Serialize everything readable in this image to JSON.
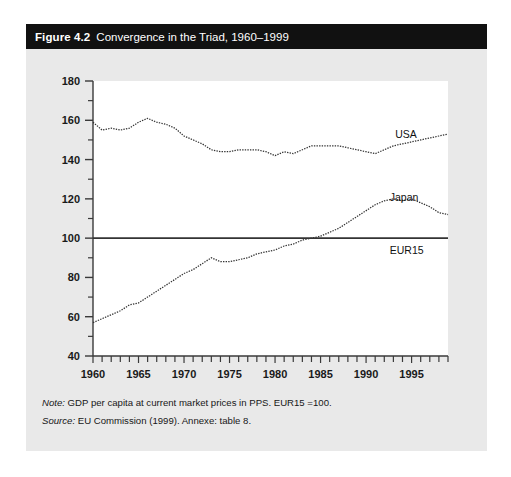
{
  "figure": {
    "number": "Figure 4.2",
    "title": "Convergence in the Triad, 1960–1999",
    "note_keyword": "Note:",
    "note_text": "GDP per capita at current market prices in PPS. EUR15 =100.",
    "source_keyword": "Source:",
    "source_text": "EU Commission (1999). Annexe: table 8."
  },
  "chart_data": {
    "type": "line",
    "title": "Convergence in the Triad, 1960–1999",
    "xlabel": "",
    "ylabel": "",
    "xlim": [
      1960,
      1999
    ],
    "ylim": [
      40,
      180
    ],
    "ytick_major": [
      40,
      60,
      80,
      100,
      120,
      140,
      160,
      180
    ],
    "ytick_minor_step": 10,
    "xtick_labels": [
      1960,
      1965,
      1970,
      1975,
      1980,
      1985,
      1990,
      1995
    ],
    "xtick_step": 1,
    "grid": false,
    "legend_position": "inline-right",
    "annotations": [
      {
        "text": "USA",
        "x": 1993.2,
        "y": 151
      },
      {
        "text": "Japan",
        "x": 1992.6,
        "y": 119
      },
      {
        "text": "EUR15",
        "x": 1992.6,
        "y": 92
      }
    ],
    "x": [
      1960,
      1961,
      1962,
      1963,
      1964,
      1965,
      1966,
      1967,
      1968,
      1969,
      1970,
      1971,
      1972,
      1973,
      1974,
      1975,
      1976,
      1977,
      1978,
      1979,
      1980,
      1981,
      1982,
      1983,
      1984,
      1985,
      1986,
      1987,
      1988,
      1989,
      1990,
      1991,
      1992,
      1993,
      1994,
      1995,
      1996,
      1997,
      1998,
      1999
    ],
    "series": [
      {
        "name": "USA",
        "style": "dotted",
        "values": [
          159,
          155,
          156,
          155,
          156,
          159,
          161,
          159,
          158,
          156,
          152,
          150,
          148,
          145,
          144,
          144,
          145,
          145,
          145,
          144,
          142,
          144,
          143,
          145,
          147,
          147,
          147,
          147,
          146,
          145,
          144,
          143,
          145,
          147,
          148,
          149,
          150,
          151,
          152,
          153
        ]
      },
      {
        "name": "Japan",
        "style": "dotted",
        "values": [
          57,
          59,
          61,
          63,
          66,
          67,
          70,
          73,
          76,
          79,
          82,
          84,
          87,
          90,
          88,
          88,
          89,
          90,
          92,
          93,
          94,
          96,
          97,
          99,
          100,
          101,
          103,
          105,
          108,
          111,
          114,
          117,
          119,
          120,
          119,
          120,
          118,
          116,
          113,
          112
        ]
      },
      {
        "name": "EUR15",
        "style": "solid",
        "values": [
          100,
          100,
          100,
          100,
          100,
          100,
          100,
          100,
          100,
          100,
          100,
          100,
          100,
          100,
          100,
          100,
          100,
          100,
          100,
          100,
          100,
          100,
          100,
          100,
          100,
          100,
          100,
          100,
          100,
          100,
          100,
          100,
          100,
          100,
          100,
          100,
          100,
          100,
          100,
          100
        ]
      }
    ]
  },
  "colors": {
    "panel_bg": "#e9e9e9",
    "plot_bg": "#ffffff",
    "title_bar": "#111111",
    "line": "#333333"
  }
}
